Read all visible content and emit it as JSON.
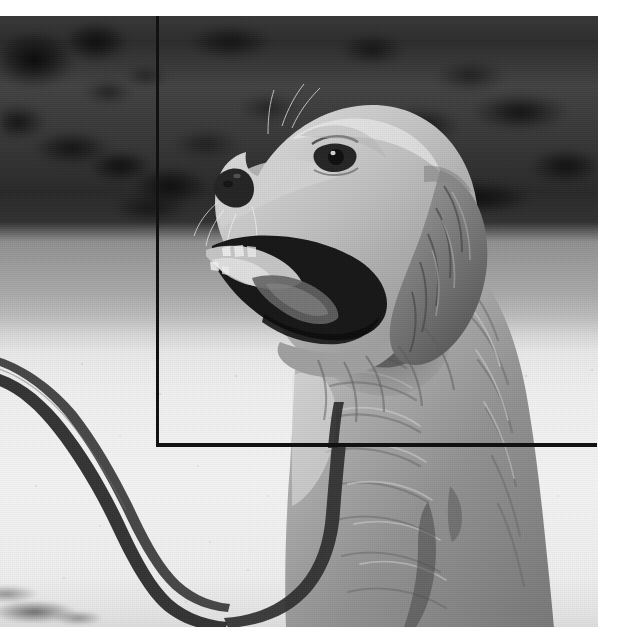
{
  "image": {
    "kind": "photograph",
    "color_mode": "grayscale",
    "subject": "golden-retriever-dog",
    "description": "Black and white photograph of a golden retriever sitting in profile, mouth open and panting, facing left, with a dark leash trailing on a bright gravel path; blurred dark hedge in the background.",
    "frame": {
      "left": 0,
      "top": 16,
      "width": 598,
      "height": 611
    },
    "canvas": {
      "width": 625,
      "height": 643,
      "background": "#ffffff"
    }
  },
  "annotation": {
    "type": "bounding-box-overlay",
    "stroke_color": "#111111",
    "stroke_width_px": 3,
    "corner": {
      "x": 157,
      "y": 444
    },
    "lines": [
      {
        "name": "vertical-guide",
        "orientation": "vertical",
        "x": 157,
        "y_start": 16,
        "y_end": 446
      },
      {
        "name": "horizontal-guide",
        "orientation": "horizontal",
        "y": 444,
        "x_start": 157,
        "x_end": 598
      }
    ]
  },
  "scene": {
    "background_label": "blurred dark hedge",
    "midground_label": "grass strip",
    "foreground_label": "bright gravel path",
    "objects": [
      {
        "name": "dog",
        "label": "golden retriever"
      },
      {
        "name": "leash",
        "label": "dark leash strap"
      },
      {
        "name": "grass-tuft",
        "label": "grass tuft"
      }
    ]
  },
  "palette": {
    "paper_white": "#ffffff",
    "hedge_dark": "#2c2c2a",
    "grass_mid": "#9b9c9b",
    "path_bright": "#eeefec",
    "fur_light": "#d8d4cc",
    "fur_mid": "#a9a49a",
    "fur_dark": "#6e6a62",
    "ink_black": "#111111"
  }
}
